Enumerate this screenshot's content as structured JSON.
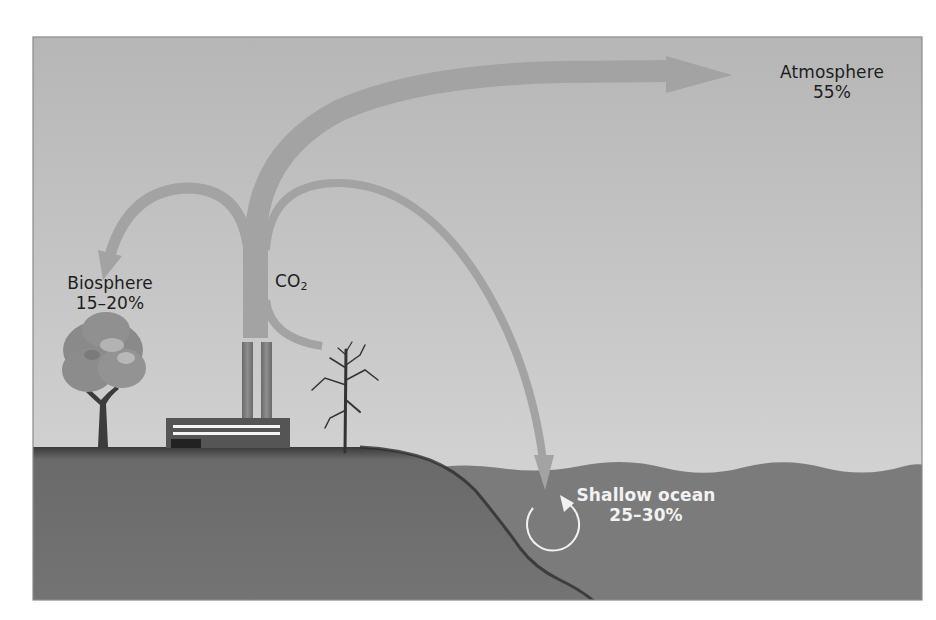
{
  "diagram": {
    "title": "",
    "source": {
      "name": "factory",
      "emission_label": "CO",
      "emission_subscript": "2"
    },
    "sinks": [
      {
        "id": "atmosphere",
        "name": "Atmosphere",
        "share": "55%"
      },
      {
        "id": "biosphere",
        "name": "Biosphere",
        "share": "15–20%"
      },
      {
        "id": "shallow-ocean",
        "name": "Shallow ocean",
        "share": "25–30%"
      }
    ],
    "colors": {
      "sky_top": "#b6b6b6",
      "sky_bottom": "#d8d8d8",
      "arrow": "#a3a3a3",
      "ground": "#6f6f6f",
      "ocean": "#7b7b7b",
      "factory": "#555555",
      "frame": "#8a8a8a",
      "label_dark": "#1e1e1e",
      "label_light": "#f2f2f2"
    }
  }
}
